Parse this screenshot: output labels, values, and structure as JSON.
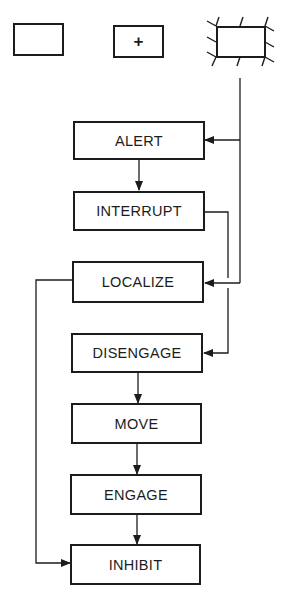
{
  "diagram": {
    "type": "flowchart",
    "colors": {
      "line": "#1c1c1c",
      "background": "#ffffff"
    },
    "legend_symbols": [
      {
        "id": "plain-box",
        "label": ""
      },
      {
        "id": "plus-box",
        "label": "+"
      },
      {
        "id": "hatched-box",
        "label": ""
      }
    ],
    "nodes": [
      {
        "id": "alert",
        "label": "ALERT"
      },
      {
        "id": "interrupt",
        "label": "INTERRUPT"
      },
      {
        "id": "localize",
        "label": "LOCALIZE"
      },
      {
        "id": "disengage",
        "label": "DISENGAGE"
      },
      {
        "id": "move",
        "label": "MOVE"
      },
      {
        "id": "engage",
        "label": "ENGAGE"
      },
      {
        "id": "inhibit",
        "label": "INHIBIT"
      }
    ],
    "edges": [
      {
        "from": "hatched-box",
        "to": "alert"
      },
      {
        "from": "hatched-box",
        "to": "localize"
      },
      {
        "from": "alert",
        "to": "interrupt"
      },
      {
        "from": "interrupt",
        "to": "disengage"
      },
      {
        "from": "localize",
        "to": "inhibit"
      },
      {
        "from": "disengage",
        "to": "move"
      },
      {
        "from": "move",
        "to": "engage"
      },
      {
        "from": "engage",
        "to": "inhibit"
      }
    ]
  }
}
